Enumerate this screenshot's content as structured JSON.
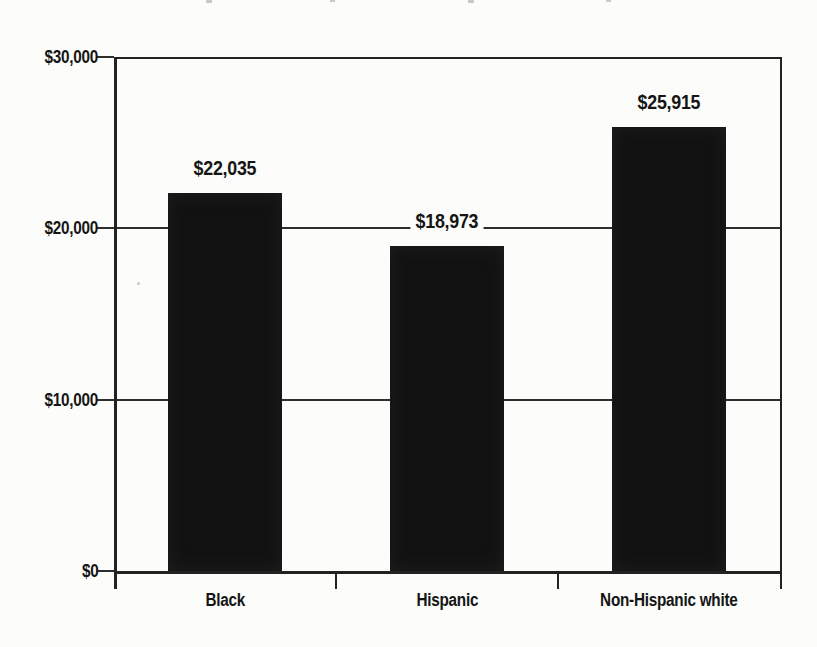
{
  "chart_data": {
    "type": "bar",
    "title": "",
    "xlabel": "",
    "ylabel": "",
    "categories": [
      "Black",
      "Hispanic",
      "Non-Hispanic white"
    ],
    "values": [
      22035,
      18973,
      25915
    ],
    "value_labels": [
      "$22,035",
      "$18,973",
      "$25,915"
    ],
    "ylim": [
      0,
      30000
    ],
    "yticks": [
      0,
      10000,
      20000,
      30000
    ],
    "ytick_labels": [
      "$0",
      "$10,000",
      "$20,000",
      "$30,000"
    ],
    "grid": true,
    "legend": false,
    "bar_color": "#121212",
    "axis_color": "#222220",
    "label_color": "#151515",
    "background_color": "#fcfcfa"
  }
}
